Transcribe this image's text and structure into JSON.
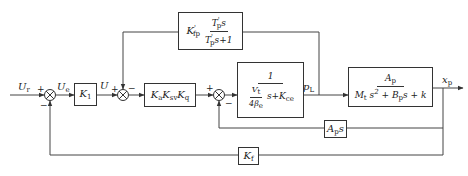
{
  "diagram": {
    "type": "control-block-diagram",
    "signals": {
      "input": "U_r",
      "error": "U_e",
      "control": "U",
      "load_pressure": "p_L",
      "output": "x_p"
    },
    "blocks": {
      "k1": {
        "label": "K",
        "sub": "1"
      },
      "amp_valve": {
        "label": "K",
        "parts": [
          {
            "base": "K",
            "sub": "a"
          },
          {
            "base": "K",
            "sub": "sv"
          },
          {
            "base": "K",
            "sub": "q"
          }
        ]
      },
      "feedforward": {
        "gain": "K",
        "gain_sub": "fp",
        "gain_sup": "'",
        "num": "T",
        "num_sub": "p",
        "num_sup": "'",
        "num_tail": "s",
        "den": "T",
        "den_sub": "p",
        "den_sup": "'",
        "den_tail": "s+1"
      },
      "hydraulic": {
        "num": "1",
        "den_frac_num": "V",
        "den_frac_num_sub": "t",
        "den_frac_den": "4β",
        "den_frac_den_sub": "e",
        "den_tail": "s+K",
        "den_tail_sub": "ce"
      },
      "plant": {
        "num": "A",
        "num_sub": "p",
        "den_a": "M",
        "den_a_sub": "t",
        "den_a_tail": "s",
        "den_a_sup": "2",
        "den_b": "+ B",
        "den_b_sub": "p",
        "den_c": "s + k"
      },
      "aps": {
        "label": "A",
        "sub": "p",
        "tail": "s"
      },
      "kf": {
        "label": "K",
        "sub": "f"
      }
    },
    "summing_junctions": [
      {
        "id": "sum1",
        "signs": {
          "left": "+",
          "bottom": "−"
        }
      },
      {
        "id": "sum2",
        "signs": {
          "left": "+",
          "top": "−"
        }
      },
      {
        "id": "sum3",
        "signs": {
          "left": "+",
          "bottom": "−"
        }
      }
    ]
  }
}
